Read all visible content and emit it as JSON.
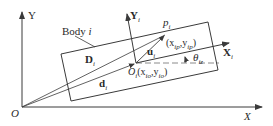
{
  "diagram": {
    "colors": {
      "stroke": "#3a3a3a",
      "dashed": "#8a8a8a",
      "background": "#ffffff"
    },
    "global_frame": {
      "origin_label": "O",
      "x_label": "X",
      "y_label": "Y"
    },
    "body": {
      "label_prefix": "Body ",
      "label_index": "i"
    },
    "local_frame": {
      "origin_label": "O",
      "origin_sub": "i",
      "origin_coords_open": "(x",
      "origin_coords_x_sub": "io",
      "origin_coords_mid": ",y",
      "origin_coords_y_sub": "io",
      "origin_coords_close": ")",
      "x_label": "X",
      "x_sub": "i",
      "y_label": "Y",
      "y_sub": "i"
    },
    "point": {
      "label": "p",
      "label_sub": "i",
      "coords_open": "(x",
      "coords_x_sub": "ip",
      "coords_mid": ",y",
      "coords_y_sub": "ip",
      "coords_close": ")"
    },
    "vectors": {
      "D_label": "D",
      "D_sub": "i",
      "d_label": "d",
      "d_sub": "i",
      "u_label": "u",
      "u_sub": "i"
    },
    "angle": {
      "label": "θ",
      "label_sub": "iz"
    }
  }
}
